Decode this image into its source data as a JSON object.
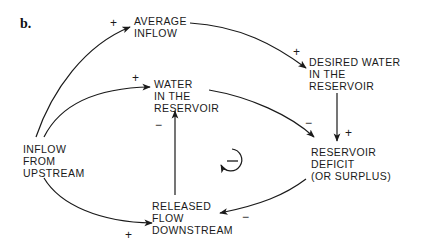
{
  "panel_label": "b.",
  "nodes": {
    "average_inflow": [
      "AVERAGE",
      "INFLOW"
    ],
    "desired_water": [
      "DESIRED WATER",
      "IN THE",
      "RESERVOIR"
    ],
    "water_in_reservoir": [
      "WATER",
      "IN THE",
      "RESERVOIR"
    ],
    "inflow_upstream": [
      "INFLOW",
      "FROM",
      "UPSTREAM"
    ],
    "reservoir_deficit": [
      "RESERVOIR",
      "DEFICIT",
      "(OR SURPLUS)"
    ],
    "released_flow": [
      "RELEASED",
      "FLOW",
      "DOWNSTREAM"
    ]
  },
  "links": [
    {
      "from": "INFLOW FROM UPSTREAM",
      "to": "AVERAGE INFLOW",
      "polarity": "+"
    },
    {
      "from": "AVERAGE INFLOW",
      "to": "DESIRED WATER IN THE RESERVOIR",
      "polarity": "+"
    },
    {
      "from": "INFLOW FROM UPSTREAM",
      "to": "WATER IN THE RESERVOIR",
      "polarity": "+"
    },
    {
      "from": "WATER IN THE RESERVOIR",
      "to": "RESERVOIR DEFICIT (OR SURPLUS)",
      "polarity": "−"
    },
    {
      "from": "DESIRED WATER IN THE RESERVOIR",
      "to": "RESERVOIR DEFICIT (OR SURPLUS)",
      "polarity": "+"
    },
    {
      "from": "RESERVOIR DEFICIT (OR SURPLUS)",
      "to": "RELEASED FLOW DOWNSTREAM",
      "polarity": "−"
    },
    {
      "from": "RELEASED FLOW DOWNSTREAM",
      "to": "WATER IN THE RESERVOIR",
      "polarity": "−"
    },
    {
      "from": "INFLOW FROM UPSTREAM",
      "to": "RELEASED FLOW DOWNSTREAM",
      "polarity": "+"
    }
  ],
  "signs": {
    "avg_inflow_in": "+",
    "desired_in": "+",
    "water_in": "+",
    "water_to_deficit": "−",
    "desired_to_deficit": "+",
    "deficit_to_released": "−",
    "released_to_water": "−",
    "upstream_to_released": "+"
  },
  "loop_indicator": {
    "polarity": "−",
    "type": "balancing"
  },
  "colors": {
    "ink": "#1a1a1a",
    "background": "#ffffff"
  }
}
